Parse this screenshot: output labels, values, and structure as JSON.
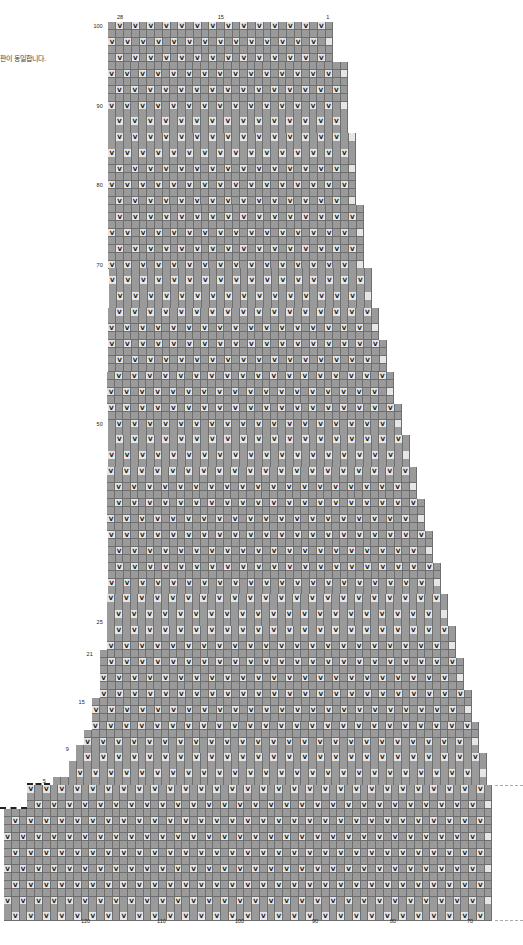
{
  "note": "판이 동일합니다.",
  "chart_data": {
    "type": "table",
    "top_column_labels": [
      {
        "label": "28",
        "col": 28
      },
      {
        "label": "15",
        "col": 15
      },
      {
        "label": "1",
        "col": 1
      }
    ],
    "bottom_column_labels": [
      {
        "label": "120",
        "x": 86
      },
      {
        "label": "110",
        "x": 162
      },
      {
        "label": "100",
        "x": 240
      },
      {
        "label": "90",
        "x": 317
      },
      {
        "label": "80",
        "x": 395
      },
      {
        "label": "70",
        "x": 472
      }
    ],
    "row_labels": [
      {
        "label": "100",
        "row": 100
      },
      {
        "label": "90",
        "row": 90
      },
      {
        "label": "80",
        "row": 80
      },
      {
        "label": "70",
        "row": 70
      },
      {
        "label": "50",
        "row": 50
      },
      {
        "label": "25",
        "row": 25
      },
      {
        "label": "21",
        "row": 21
      },
      {
        "label": "15",
        "row": 15
      },
      {
        "label": "9",
        "row": 9
      },
      {
        "label": "5",
        "row": 5
      }
    ],
    "symbols": {
      "V": "slip stitch",
      "lean_left": "decrease (/)",
      "lean_right": "decrease (\\)",
      "double": "double decrease (^)"
    },
    "legend_colors": {
      "dark": "#9a9a9a",
      "light": "#e6e6e6"
    },
    "rows_total": 100,
    "setup_rows_below": 12,
    "grid": {
      "left_x": 107,
      "top_y": 22,
      "cell_w": 7.75,
      "cell_h": 7.95,
      "right_edge_by_row": [
        {
          "from_row": 96,
          "to_row": 100,
          "right_x": 333
        },
        {
          "from_row": 87,
          "to_row": 95,
          "right_x": 348
        },
        {
          "from_row": 78,
          "to_row": 86,
          "right_x": 356
        },
        {
          "from_row": 70,
          "to_row": 77,
          "right_x": 364
        },
        {
          "from_row": 65,
          "to_row": 69,
          "right_x": 372
        },
        {
          "from_row": 61,
          "to_row": 64,
          "right_x": 379
        },
        {
          "from_row": 57,
          "to_row": 60,
          "right_x": 387
        },
        {
          "from_row": 53,
          "to_row": 56,
          "right_x": 394
        },
        {
          "from_row": 49,
          "to_row": 52,
          "right_x": 402
        },
        {
          "from_row": 45,
          "to_row": 48,
          "right_x": 410
        },
        {
          "from_row": 41,
          "to_row": 44,
          "right_x": 417
        },
        {
          "from_row": 37,
          "to_row": 40,
          "right_x": 425
        },
        {
          "from_row": 33,
          "to_row": 36,
          "right_x": 433
        },
        {
          "from_row": 29,
          "to_row": 32,
          "right_x": 441
        },
        {
          "from_row": 25,
          "to_row": 28,
          "right_x": 448
        },
        {
          "from_row": 21,
          "to_row": 24,
          "right_x": 456
        },
        {
          "from_row": 17,
          "to_row": 20,
          "right_x": 464
        },
        {
          "from_row": 13,
          "to_row": 16,
          "right_x": 472
        },
        {
          "from_row": 9,
          "to_row": 12,
          "right_x": 479
        },
        {
          "from_row": 5,
          "to_row": 8,
          "right_x": 487
        },
        {
          "from_row": -12,
          "to_row": 4,
          "right_x": 492
        }
      ],
      "left_edge_by_row": [
        {
          "from_row": 22,
          "to_row": 100,
          "left_x": 107
        },
        {
          "from_row": 16,
          "to_row": 21,
          "left_x": 97
        },
        {
          "from_row": 12,
          "to_row": 15,
          "left_x": 89
        },
        {
          "from_row": 10,
          "to_row": 11,
          "left_x": 81
        },
        {
          "from_row": 8,
          "to_row": 9,
          "left_x": 73
        },
        {
          "from_row": 6,
          "to_row": 7,
          "left_x": 65
        },
        {
          "from_row": 5,
          "to_row": 5,
          "left_x": 50
        },
        {
          "from_row": 2,
          "to_row": 4,
          "left_x": 27
        },
        {
          "from_row": -12,
          "to_row": 1,
          "left_x": 0
        }
      ]
    }
  }
}
